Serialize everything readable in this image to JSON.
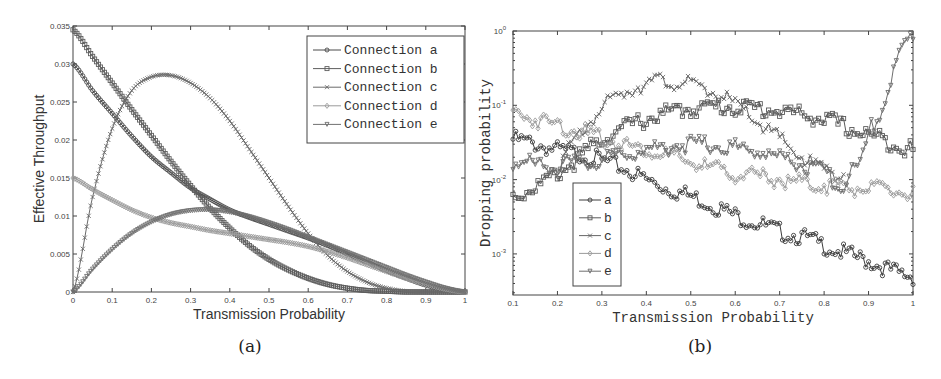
{
  "chart_data": [
    {
      "id": "a",
      "type": "line",
      "caption": "(a)",
      "title": "",
      "xlabel": "Transmission Probability",
      "ylabel": "Effective Throughput",
      "xlim": [
        0,
        1
      ],
      "ylim": [
        0,
        0.035
      ],
      "xscale": "linear",
      "yscale": "linear",
      "grid": false,
      "legend_position": "upper right",
      "x_ticks": [
        "0",
        "0.1",
        "0.2",
        "0.3",
        "0.4",
        "0.5",
        "0.6",
        "0.7",
        "0.8",
        "0.9",
        "1"
      ],
      "y_ticks": [
        "0",
        "0.005",
        "0.01",
        "0.015",
        "0.02",
        "0.025",
        "0.03",
        "0.035"
      ],
      "x": [
        0,
        0.05,
        0.1,
        0.15,
        0.2,
        0.25,
        0.3,
        0.35,
        0.4,
        0.45,
        0.5,
        0.55,
        0.6,
        0.65,
        0.7,
        0.75,
        0.8,
        0.85,
        0.9,
        0.95,
        1.0
      ],
      "series": [
        {
          "name": "Connection a",
          "marker": "circle",
          "color": "#4a4a4a",
          "values": [
            0.03,
            0.0265,
            0.0235,
            0.0205,
            0.0178,
            0.0157,
            0.0137,
            0.0122,
            0.0108,
            0.0098,
            0.0089,
            0.008,
            0.0071,
            0.0061,
            0.005,
            0.0039,
            0.0028,
            0.0018,
            0.0009,
            0.0003,
            0.0
          ]
        },
        {
          "name": "Connection b",
          "marker": "square",
          "color": "#5e5e5e",
          "values": [
            0.0345,
            0.031,
            0.0275,
            0.024,
            0.0206,
            0.0172,
            0.014,
            0.011,
            0.0084,
            0.0061,
            0.0043,
            0.0029,
            0.0018,
            0.001,
            0.0005,
            0.0002,
            0.0001,
            0.0,
            0.0,
            0.0,
            0.0
          ]
        },
        {
          "name": "Connection c",
          "marker": "x",
          "color": "#6a6a6a",
          "values": [
            0.0,
            0.0125,
            0.0215,
            0.0265,
            0.0283,
            0.0285,
            0.0275,
            0.0255,
            0.0225,
            0.0188,
            0.015,
            0.0112,
            0.0077,
            0.0048,
            0.0027,
            0.0013,
            0.0005,
            0.0001,
            0.0,
            0.0,
            0.0
          ]
        },
        {
          "name": "Connection d",
          "marker": "diamond",
          "color": "#9a9a9a",
          "values": [
            0.015,
            0.0135,
            0.0121,
            0.0108,
            0.0098,
            0.0091,
            0.0086,
            0.0081,
            0.0077,
            0.0073,
            0.0069,
            0.0065,
            0.006,
            0.0053,
            0.0045,
            0.0036,
            0.0027,
            0.0018,
            0.001,
            0.0004,
            0.0
          ]
        },
        {
          "name": "Connection e",
          "marker": "triangle-down",
          "color": "#707070",
          "values": [
            0.0,
            0.003,
            0.0056,
            0.0077,
            0.0092,
            0.0102,
            0.0107,
            0.0108,
            0.0105,
            0.0099,
            0.0091,
            0.0082,
            0.0072,
            0.0062,
            0.0052,
            0.0042,
            0.0032,
            0.0022,
            0.0013,
            0.0005,
            0.0
          ]
        }
      ]
    },
    {
      "id": "b",
      "type": "line",
      "caption": "(b)",
      "title": "",
      "xlabel": "Transmission Probability",
      "ylabel": "Dropping probability",
      "xlim": [
        0.1,
        1
      ],
      "ylim": [
        0.00028,
        1
      ],
      "xscale": "linear",
      "yscale": "log",
      "grid": false,
      "legend_position": "lower left",
      "x_ticks": [
        "0.1",
        "0.2",
        "0.3",
        "0.4",
        "0.5",
        "0.6",
        "0.7",
        "0.8",
        "0.9",
        "1"
      ],
      "y_ticks": [
        "10^-3",
        "10^-2",
        "10^-1",
        "10^0"
      ],
      "x": [
        0.1,
        0.15,
        0.2,
        0.25,
        0.3,
        0.35,
        0.4,
        0.45,
        0.5,
        0.55,
        0.6,
        0.65,
        0.7,
        0.75,
        0.8,
        0.85,
        0.9,
        0.95,
        1.0
      ],
      "series": [
        {
          "name": "a",
          "marker": "circle",
          "color": "#3c3c3c",
          "values": [
            0.035,
            0.03,
            0.025,
            0.022,
            0.018,
            0.014,
            0.01,
            0.0075,
            0.006,
            0.0045,
            0.0033,
            0.0026,
            0.002,
            0.0017,
            0.0013,
            0.001,
            0.0008,
            0.0006,
            0.0005
          ]
        },
        {
          "name": "b",
          "marker": "square",
          "color": "#5a5a5a",
          "values": [
            0.006,
            0.008,
            0.012,
            0.02,
            0.035,
            0.05,
            0.065,
            0.08,
            0.09,
            0.095,
            0.095,
            0.09,
            0.085,
            0.075,
            0.065,
            0.05,
            0.04,
            0.032,
            0.025
          ]
        },
        {
          "name": "c",
          "marker": "x",
          "color": "#666666",
          "values": [
            null,
            null,
            0.015,
            0.04,
            0.09,
            0.15,
            0.2,
            0.21,
            0.185,
            0.15,
            0.1,
            0.06,
            0.035,
            0.02,
            0.014,
            0.012,
            null,
            null,
            null
          ]
        },
        {
          "name": "d",
          "marker": "diamond",
          "color": "#9a9a9a",
          "values": [
            0.08,
            0.065,
            0.055,
            0.045,
            0.036,
            0.03,
            0.025,
            0.021,
            0.017,
            0.014,
            0.012,
            0.011,
            0.01,
            0.009,
            0.0085,
            0.008,
            0.0075,
            0.007,
            0.0065
          ]
        },
        {
          "name": "e",
          "marker": "triangle-down",
          "color": "#6e6e6e",
          "values": [
            0.017,
            0.016,
            0.016,
            0.016,
            0.018,
            0.022,
            0.025,
            0.028,
            0.03,
            0.029,
            0.027,
            0.024,
            0.02,
            0.016,
            0.012,
            0.01,
            0.04,
            0.2,
            0.9
          ]
        }
      ]
    }
  ]
}
